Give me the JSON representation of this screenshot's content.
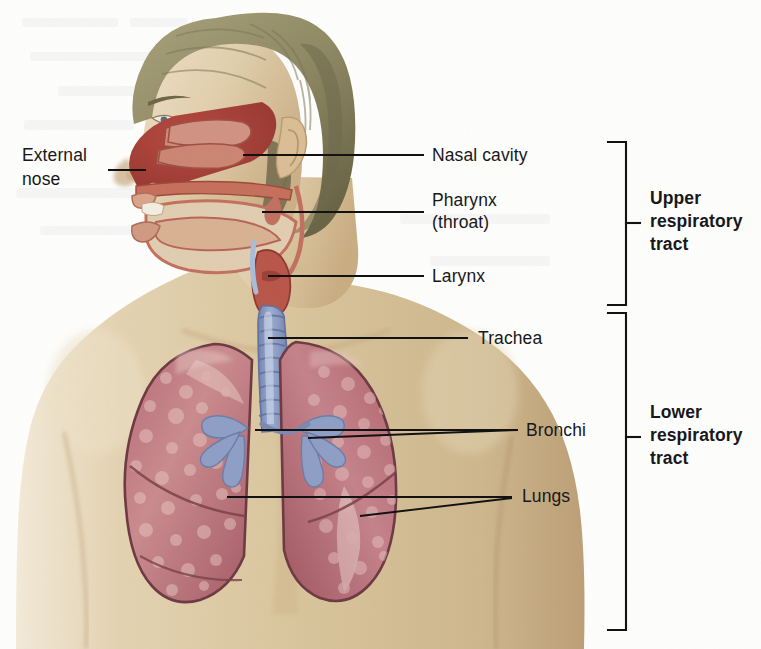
{
  "figure": {
    "background_color": "#fdfdfb",
    "leader_line_color": "#121212"
  },
  "palette": {
    "skin_light": "#e7d7bb",
    "skin_mid": "#d9c49c",
    "skin_shadow": "#c9ad82",
    "hair": "#9a9470",
    "hair_dark": "#6f6a4c",
    "nasal_cavity": "#a8413a",
    "mucosa": "#c9705f",
    "lung": "#b9707a",
    "lung_light": "#cf8f93",
    "lung_outline": "#6e3a43",
    "trachea": "#8e9ec4",
    "trachea_dark": "#6d7da8",
    "larynx": "#b8564a"
  },
  "labels": {
    "external_nose": {
      "line1": "External",
      "line2": "nose"
    },
    "nasal_cavity": "Nasal cavity",
    "pharynx": {
      "line1": "Pharynx",
      "line2": "(throat)"
    },
    "larynx": "Larynx",
    "trachea": "Trachea",
    "bronchi": "Bronchi",
    "lungs": "Lungs"
  },
  "brackets": {
    "upper": {
      "line1": "Upper",
      "line2": "respiratory",
      "line3": "tract"
    },
    "lower": {
      "line1": "Lower",
      "line2": "respiratory",
      "line3": "tract"
    }
  }
}
